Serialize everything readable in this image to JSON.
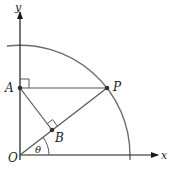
{
  "figure": {
    "axes": {
      "x_label": "x",
      "y_label": "y"
    },
    "points": {
      "O": {
        "label": "O"
      },
      "A": {
        "label": "A"
      },
      "P": {
        "label": "P"
      },
      "B": {
        "label": "B"
      }
    },
    "angle": {
      "label": "θ"
    },
    "colors": {
      "line": "#555555",
      "arc": "#6b6b6b",
      "text": "#1a1a1a"
    }
  }
}
